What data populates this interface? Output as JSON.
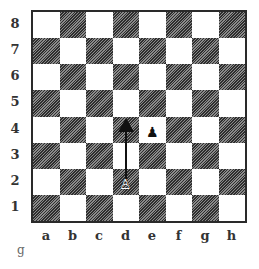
{
  "diagram": {
    "type": "chess-board",
    "ranks": [
      "8",
      "7",
      "6",
      "5",
      "4",
      "3",
      "2",
      "1"
    ],
    "files": [
      "a",
      "b",
      "c",
      "d",
      "e",
      "f",
      "g",
      "h"
    ],
    "pieces": [
      {
        "square": "d2",
        "piece": "white-pawn",
        "glyph": "♙"
      },
      {
        "square": "e4",
        "piece": "black-pawn",
        "glyph": "♟"
      }
    ],
    "arrow": {
      "from": "d2",
      "to": "d4"
    },
    "caption": "g",
    "colors": {
      "dark_square": "#5a5a5a",
      "light_square": "#ffffff",
      "border": "#2a2a2a"
    }
  }
}
